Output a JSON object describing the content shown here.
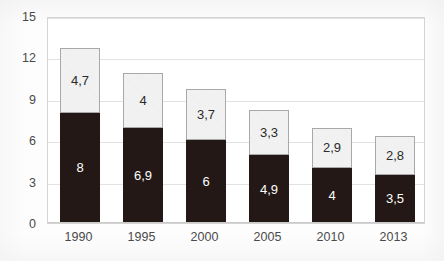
{
  "chart_data": {
    "type": "bar",
    "stacked": true,
    "title": "",
    "subtitle": "",
    "xlabel": "",
    "ylabel": "",
    "categories": [
      "1990",
      "1995",
      "2000",
      "2005",
      "2010",
      "2013"
    ],
    "series": [
      {
        "name": "lower-segment",
        "color": "#231815",
        "values": [
          8,
          6.9,
          6,
          4.9,
          4,
          3.5
        ],
        "labels": [
          "8",
          "6,9",
          "6",
          "4,9",
          "4",
          "3,5"
        ]
      },
      {
        "name": "upper-segment",
        "color": "#f2f2f2",
        "values": [
          4.7,
          4,
          3.7,
          3.3,
          2.9,
          2.8
        ],
        "labels": [
          "4,7",
          "4",
          "3,7",
          "3,3",
          "2,9",
          "2,8"
        ]
      }
    ],
    "totals": [
      12.7,
      10.9,
      9.7,
      8.2,
      6.9,
      6.3
    ],
    "ylim": [
      0,
      15
    ],
    "ytick_values": [
      0,
      3,
      6,
      9,
      12,
      15
    ],
    "ytick_labels": [
      "0",
      "3",
      "6",
      "9",
      "12",
      "15"
    ],
    "grid": true,
    "grid_axis": "y",
    "legend": false,
    "legend_position": "none",
    "decimal_separator": ","
  },
  "axes": {
    "y_labels": [
      "15",
      "12",
      "9",
      "6",
      "3",
      "0"
    ],
    "x_labels": [
      "1990",
      "1995",
      "2000",
      "2005",
      "2010",
      "2013"
    ]
  },
  "colors": {
    "dark_segment": "#231815",
    "light_segment": "#f2f2f2",
    "light_segment_border": "#a8a8a8",
    "gridline": "#e2e2e2",
    "frame": "#d4d4d4",
    "tick_text": "#4a4a4a",
    "plot_background": "#ffffff"
  }
}
